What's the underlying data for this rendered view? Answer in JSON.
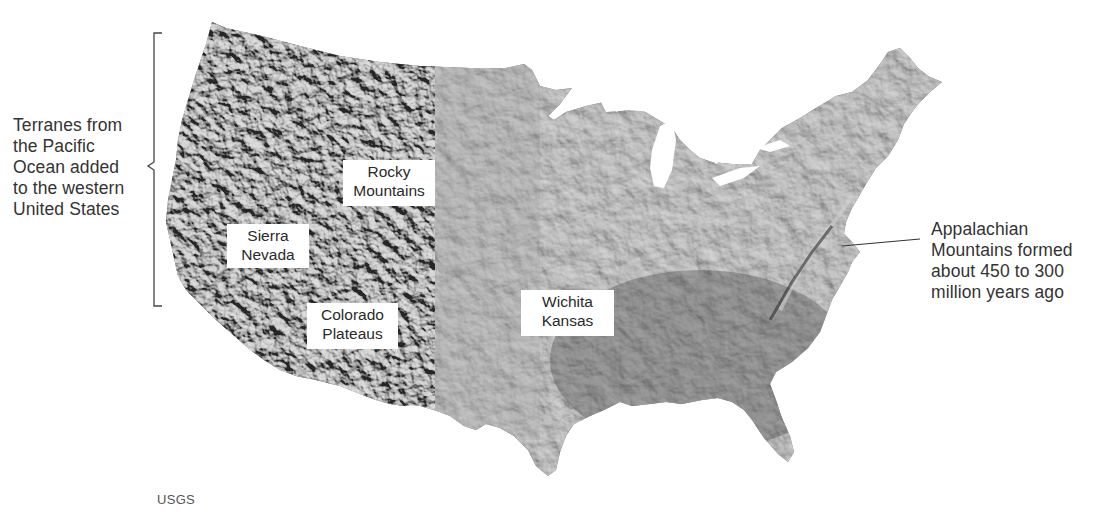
{
  "map": {
    "subject": "Shaded relief map of the contiguous United States",
    "background_color": "#ffffff",
    "land_color": "#6f6f6f",
    "annotations": {
      "west_bracket": {
        "lines": [
          "Terranes from",
          "the Pacific",
          "Ocean added",
          "to the western",
          "United States"
        ]
      },
      "appalachian": {
        "lines": [
          "Appalachian",
          "Mountains formed",
          "about 450 to 300",
          "million years ago"
        ]
      }
    },
    "region_labels": [
      {
        "id": "rocky-mountains",
        "lines": [
          "Rocky",
          "Mountains"
        ]
      },
      {
        "id": "sierra-nevada",
        "lines": [
          "Sierra",
          "Nevada"
        ]
      },
      {
        "id": "colorado-plateaus",
        "lines": [
          "Colorado",
          "Plateaus"
        ]
      },
      {
        "id": "wichita-kansas",
        "lines": [
          "Wichita",
          "Kansas"
        ]
      }
    ],
    "credit": "USGS"
  }
}
